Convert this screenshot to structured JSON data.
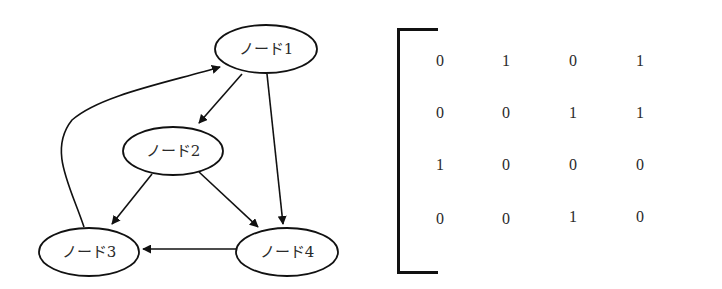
{
  "graph": {
    "nodes": [
      {
        "id": "n1",
        "label": "ノード1"
      },
      {
        "id": "n2",
        "label": "ノード2"
      },
      {
        "id": "n3",
        "label": "ノード3"
      },
      {
        "id": "n4",
        "label": "ノード4"
      }
    ],
    "edges": [
      {
        "from": "ノード1",
        "to": "ノード2"
      },
      {
        "from": "ノード1",
        "to": "ノード4"
      },
      {
        "from": "ノード2",
        "to": "ノード3"
      },
      {
        "from": "ノード2",
        "to": "ノード4"
      },
      {
        "from": "ノード3",
        "to": "ノード1"
      },
      {
        "from": "ノード4",
        "to": "ノード3"
      }
    ]
  },
  "matrix": {
    "rows": [
      [
        "0",
        "1",
        "0",
        "1"
      ],
      [
        "0",
        "0",
        "1",
        "1"
      ],
      [
        "1",
        "0",
        "0",
        "0"
      ],
      [
        "0",
        "0",
        "1",
        "0"
      ]
    ]
  }
}
